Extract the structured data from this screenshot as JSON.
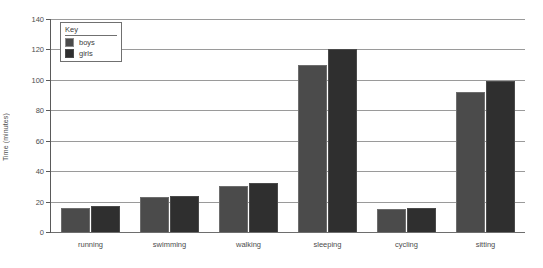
{
  "chart_data": {
    "type": "bar",
    "title": "",
    "xlabel": "",
    "ylabel": "Time (minutes)",
    "ylim": [
      0,
      140
    ],
    "ytick_step": 20,
    "yticks": [
      0,
      20,
      40,
      60,
      80,
      100,
      120,
      140
    ],
    "grid": true,
    "legend_position": "upper-left-inside",
    "legend_title": "Key",
    "categories": [
      "running",
      "swimming",
      "walking",
      "sleeping",
      "cycling",
      "sitting"
    ],
    "series": [
      {
        "name": "boys",
        "color": "#4b4b4b",
        "values": [
          16,
          23,
          30,
          110,
          15,
          92
        ]
      },
      {
        "name": "girls",
        "color": "#2f2f2f",
        "values": [
          17,
          24,
          32,
          120,
          16,
          99
        ]
      }
    ]
  },
  "axis": {
    "y_label": "Time (minutes)",
    "y_ticks": [
      "0",
      "20",
      "40",
      "60",
      "80",
      "100",
      "120",
      "140"
    ]
  },
  "legend": {
    "title": "Key",
    "items": [
      {
        "label": "boys",
        "swatch": "boys-swatch-icon"
      },
      {
        "label": "girls",
        "swatch": "girls-swatch-icon"
      }
    ]
  },
  "categories": [
    "running",
    "swimming",
    "walking",
    "sleeping",
    "cycling",
    "sitting"
  ]
}
